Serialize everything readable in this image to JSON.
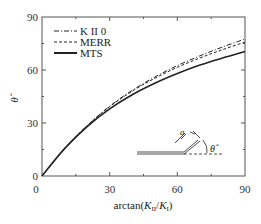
{
  "chart_data": {
    "type": "line",
    "title": "",
    "xlabel": "arctan(K_II/K_I)",
    "ylabel": "θ̂",
    "xlim": [
      0,
      90
    ],
    "ylim": [
      0,
      90
    ],
    "xticks": [
      0,
      30,
      60,
      90
    ],
    "yticks": [
      0,
      30,
      60,
      90
    ],
    "grid": false,
    "legend_position": "upper left",
    "x": [
      0,
      10,
      20,
      30,
      40,
      50,
      60,
      70,
      80,
      90
    ],
    "series": [
      {
        "name": "K II 0",
        "style": "dash-dot",
        "values": [
          0,
          15.5,
          28.5,
          39.5,
          48.5,
          56.0,
          62.5,
          68.0,
          73.0,
          77.5
        ]
      },
      {
        "name": "MERR",
        "style": "dashed",
        "values": [
          0,
          15.5,
          28.5,
          39.2,
          48.0,
          55.3,
          61.5,
          66.8,
          71.5,
          75.8
        ]
      },
      {
        "name": "MTS",
        "style": "solid",
        "values": [
          0,
          15.5,
          28.0,
          38.0,
          46.0,
          52.5,
          58.0,
          62.8,
          66.8,
          70.5
        ]
      }
    ],
    "annotations": [
      "inset crack sketch with kink angle θ̂ and branch length a"
    ]
  },
  "axes": {
    "x_title_main": "arctan(",
    "x_title_k1": "K",
    "x_title_sub1": "II",
    "x_title_slash": "/",
    "x_title_k2": "K",
    "x_title_sub2": "I",
    "x_title_close": ")",
    "y_title": "θ̂",
    "x_tick_labels": [
      "0",
      "30",
      "60",
      "90"
    ],
    "y_tick_labels": [
      "0",
      "30",
      "60",
      "90"
    ]
  },
  "legend": {
    "items": [
      {
        "label": "K II 0"
      },
      {
        "label": "MERR"
      },
      {
        "label": "MTS"
      }
    ]
  },
  "inset": {
    "theta_label": "θ̂",
    "a_label": "a"
  },
  "colors": {
    "line": "#222222",
    "axis": "#555555"
  }
}
